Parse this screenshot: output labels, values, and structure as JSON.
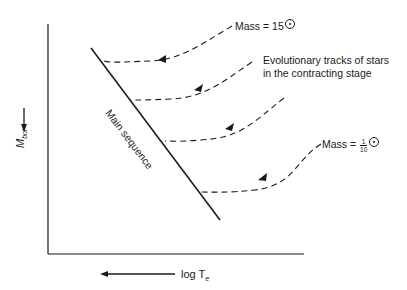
{
  "diagram": {
    "type": "HR diagram - pre-main-sequence contraction tracks",
    "x_axis": {
      "label": "log T",
      "subscript": "e",
      "direction": "increases to the left"
    },
    "y_axis": {
      "label": "M",
      "subscript": "bol",
      "direction": "increases downward"
    },
    "main_sequence_label": "Main sequence",
    "annotations": {
      "top_mass": {
        "prefix": "Mass = 15",
        "symbol": "sun"
      },
      "tracks": "Evolutionary tracks of stars in the contracting stage",
      "bottom_mass": {
        "prefix": "Mass = ",
        "numerator": "1",
        "denominator": "10",
        "symbol": "sun"
      }
    },
    "tracks_count": 4,
    "colors": {
      "line": "#1a1a1a",
      "background": "#ffffff"
    }
  }
}
